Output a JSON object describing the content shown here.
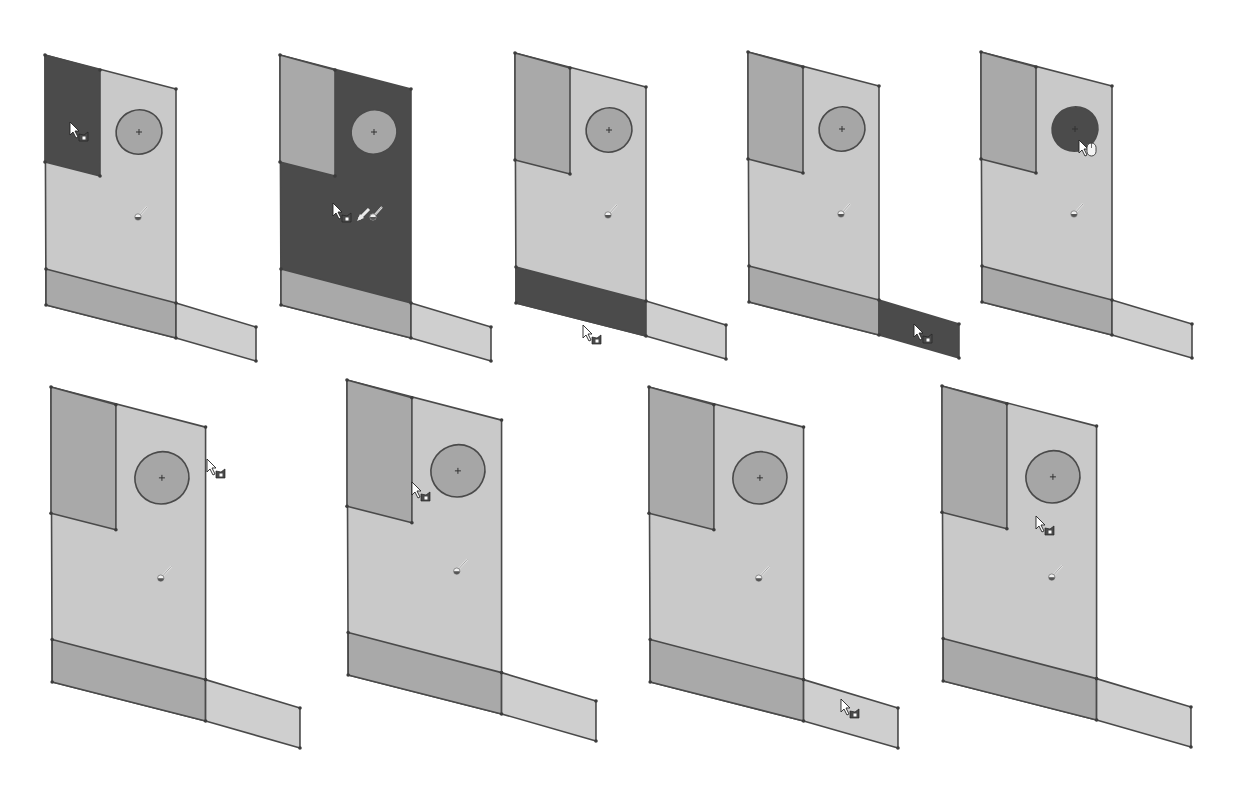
{
  "figure": {
    "colors": {
      "background": "#ffffff",
      "face_default": "#c9c9c9",
      "face_medium": "#a9a9a9",
      "face_selected": "#4b4b4b",
      "ellipse_default": "#a6a6a6",
      "tab_default": "#cfcfcf",
      "edge": "#4a4a4a"
    },
    "panels": [
      {
        "id": 1,
        "x": 45,
        "y": 55,
        "scale": 1.0,
        "selected": "left_rect",
        "cursor": {
          "type": "select-face",
          "dx": 25,
          "dy": 67
        }
      },
      {
        "id": 2,
        "x": 280,
        "y": 55,
        "scale": 1.0,
        "selected": "main",
        "cursor": {
          "type": "select-face-move",
          "dx": 53,
          "dy": 148
        }
      },
      {
        "id": 3,
        "x": 515,
        "y": 53,
        "scale": 1.0,
        "selected": "strip",
        "cursor": {
          "type": "select-face",
          "dx": 68,
          "dy": 272
        }
      },
      {
        "id": 4,
        "x": 748,
        "y": 52,
        "scale": 1.0,
        "selected": "tab",
        "cursor": {
          "type": "select-face",
          "dx": 166,
          "dy": 272
        }
      },
      {
        "id": 5,
        "x": 981,
        "y": 52,
        "scale": 1.0,
        "selected": "ellipse",
        "cursor": {
          "type": "mouse",
          "dx": 98,
          "dy": 88
        }
      },
      {
        "id": 6,
        "x": 51,
        "y": 387,
        "scale": 1.18,
        "selected": "none",
        "cursor": {
          "type": "select-face",
          "dx": 156,
          "dy": 72
        }
      },
      {
        "id": 7,
        "x": 347,
        "y": 380,
        "scale": 1.18,
        "selected": "none",
        "cursor": {
          "type": "select-face",
          "dx": 65,
          "dy": 102
        }
      },
      {
        "id": 8,
        "x": 649,
        "y": 387,
        "scale": 1.18,
        "selected": "none",
        "cursor": {
          "type": "select-face",
          "dx": 192,
          "dy": 312
        }
      },
      {
        "id": 9,
        "x": 942,
        "y": 386,
        "scale": 1.18,
        "selected": "none",
        "cursor": {
          "type": "select-face",
          "dx": 94,
          "dy": 130
        }
      }
    ]
  }
}
